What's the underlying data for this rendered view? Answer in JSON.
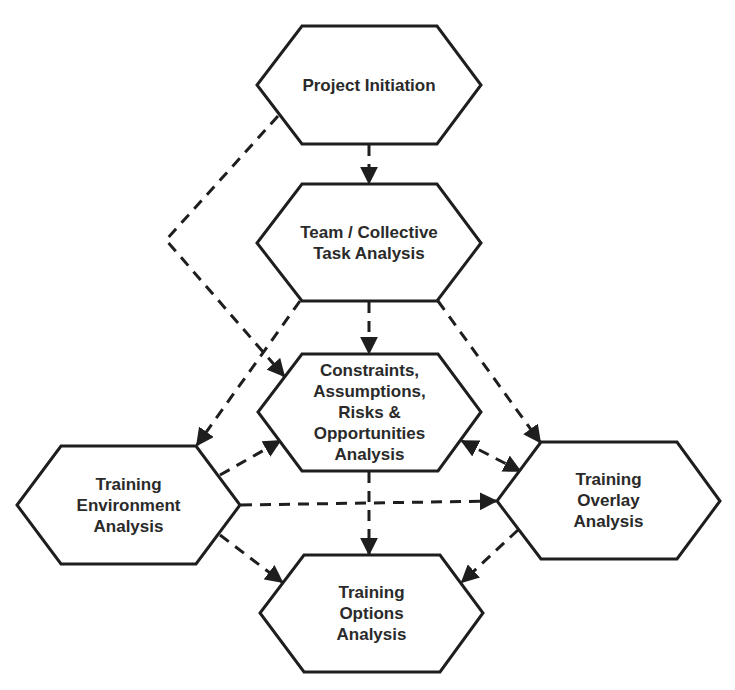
{
  "diagram": {
    "type": "flow",
    "colors": {
      "stroke": "#1e1e1e",
      "fill": "#ffffff",
      "text": "#2a2a2a"
    },
    "nodes": [
      {
        "id": "project-initiation",
        "label": "Project Initiation"
      },
      {
        "id": "team-collective",
        "label": "Team / Collective\nTask Analysis"
      },
      {
        "id": "constraints",
        "label": "Constraints,\nAssumptions,\nRisks &\nOpportunities\nAnalysis"
      },
      {
        "id": "training-environment",
        "label": "Training\nEnvironment\nAnalysis"
      },
      {
        "id": "training-overlay",
        "label": "Training\nOverlay\nAnalysis"
      },
      {
        "id": "training-options",
        "label": "Training\nOptions\nAnalysis"
      }
    ],
    "edges": [
      {
        "from": "project-initiation",
        "to": "team-collective",
        "style": "dashed"
      },
      {
        "from": "project-initiation",
        "to": "constraints",
        "style": "dashed"
      },
      {
        "from": "team-collective",
        "to": "constraints",
        "style": "dashed"
      },
      {
        "from": "team-collective",
        "to": "training-environment",
        "style": "dashed"
      },
      {
        "from": "team-collective",
        "to": "training-overlay",
        "style": "dashed"
      },
      {
        "from": "training-environment",
        "to": "constraints",
        "style": "dashed"
      },
      {
        "from": "training-environment",
        "to": "training-overlay",
        "style": "dashed"
      },
      {
        "from": "training-environment",
        "to": "training-options",
        "style": "dashed"
      },
      {
        "from": "constraints",
        "to": "training-overlay",
        "style": "dashed",
        "bidirectional": true
      },
      {
        "from": "constraints",
        "to": "training-options",
        "style": "dashed"
      },
      {
        "from": "training-overlay",
        "to": "training-options",
        "style": "dashed"
      }
    ]
  }
}
